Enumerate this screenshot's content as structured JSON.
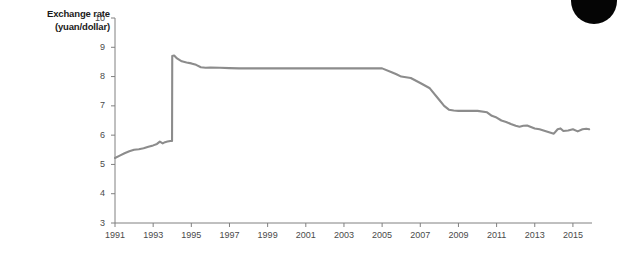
{
  "figure": {
    "axis_title_line1": "Exchange rate",
    "axis_title_line2": "(yuan/dollar)",
    "line_color": "#8c8c8c",
    "axis_color": "#808080",
    "tick_label_color": "#4a4a4a",
    "background_color": "#ffffff",
    "corner_mark_color": "#050505"
  },
  "chart_data": {
    "type": "line",
    "title": "",
    "subtitle": "",
    "xlabel": "",
    "ylabel": "Exchange rate (yuan/dollar)",
    "xlim": [
      1991,
      2016
    ],
    "ylim": [
      3,
      10
    ],
    "grid": false,
    "legend": "none",
    "ytick_labels": [
      "3",
      "4",
      "5",
      "6",
      "7",
      "8",
      "9",
      "10"
    ],
    "ytick_values": [
      3,
      4,
      5,
      6,
      7,
      8,
      9,
      10
    ],
    "xtick_labels": [
      "1991",
      "1993",
      "1995",
      "1997",
      "1999",
      "2001",
      "2003",
      "2005",
      "2007",
      "2009",
      "2011",
      "2013",
      "2015"
    ],
    "xtick_values": [
      1991,
      1993,
      1995,
      1997,
      1999,
      2001,
      2003,
      2005,
      2007,
      2009,
      2011,
      2013,
      2015
    ],
    "series": [
      {
        "name": "Yuan per U.S. dollar",
        "x": [
          1991.0,
          1991.25,
          1991.5,
          1991.75,
          1992.0,
          1992.25,
          1992.5,
          1992.75,
          1993.0,
          1993.2,
          1993.35,
          1993.5,
          1993.62,
          1993.75,
          1993.9,
          1993.99,
          1994.0,
          1994.1,
          1994.25,
          1994.5,
          1994.75,
          1995.0,
          1995.25,
          1995.5,
          1995.75,
          1996.0,
          1996.5,
          1997.0,
          1997.5,
          1998.0,
          1999.0,
          2000.0,
          2001.0,
          2002.0,
          2003.0,
          2004.0,
          2005.0,
          2005.5,
          2005.75,
          2006.0,
          2006.5,
          2007.0,
          2007.5,
          2008.0,
          2008.25,
          2008.5,
          2008.75,
          2009.0,
          2009.5,
          2010.0,
          2010.5,
          2010.75,
          2011.0,
          2011.25,
          2011.5,
          2011.75,
          2012.0,
          2012.2,
          2012.4,
          2012.6,
          2012.8,
          2013.0,
          2013.25,
          2013.5,
          2013.75,
          2014.0,
          2014.2,
          2014.35,
          2014.5,
          2014.75,
          2015.0,
          2015.25,
          2015.5,
          2015.7,
          2015.85
        ],
        "values": [
          5.22,
          5.3,
          5.38,
          5.45,
          5.5,
          5.52,
          5.55,
          5.6,
          5.65,
          5.7,
          5.78,
          5.72,
          5.76,
          5.78,
          5.8,
          5.8,
          8.7,
          8.72,
          8.62,
          8.52,
          8.48,
          8.45,
          8.4,
          8.32,
          8.3,
          8.31,
          8.3,
          8.29,
          8.28,
          8.28,
          8.28,
          8.28,
          8.28,
          8.28,
          8.28,
          8.28,
          8.28,
          8.15,
          8.08,
          8.0,
          7.95,
          7.78,
          7.6,
          7.2,
          7.0,
          6.87,
          6.84,
          6.83,
          6.83,
          6.83,
          6.78,
          6.66,
          6.6,
          6.5,
          6.45,
          6.38,
          6.32,
          6.29,
          6.32,
          6.33,
          6.28,
          6.23,
          6.2,
          6.15,
          6.1,
          6.05,
          6.2,
          6.23,
          6.14,
          6.16,
          6.2,
          6.13,
          6.2,
          6.22,
          6.2
        ]
      }
    ],
    "annotations": [
      {
        "label": "1994 devaluation",
        "x": 1994.0,
        "from": 5.8,
        "to": 8.7
      },
      {
        "label": "dollar peg plateau",
        "x_range": [
          1998,
          2005
        ],
        "value": 8.28
      },
      {
        "label": "post-2008 plateau",
        "x_range": [
          2008.75,
          2010.25
        ],
        "value": 6.83
      }
    ]
  }
}
